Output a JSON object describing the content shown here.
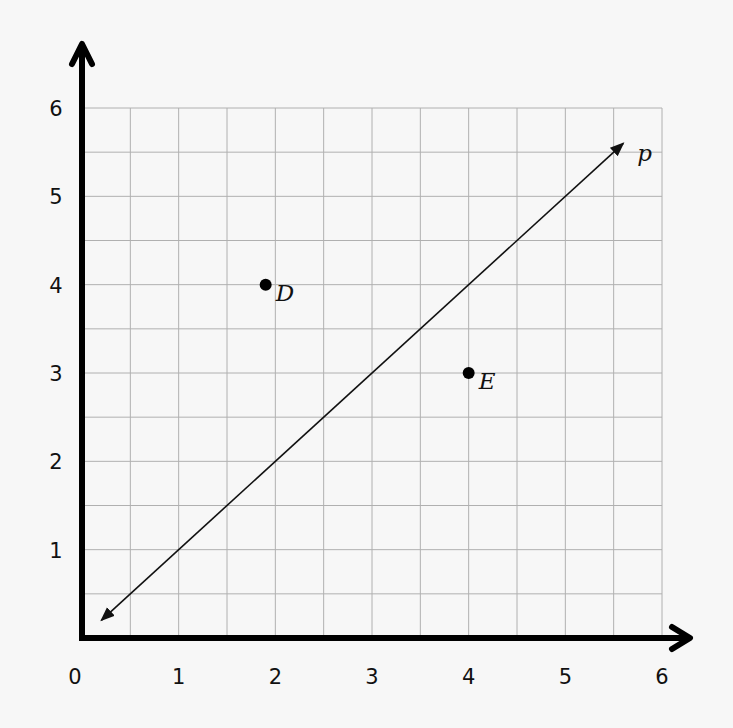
{
  "chart_data": {
    "type": "scatter",
    "title": "",
    "xlabel": "",
    "ylabel": "",
    "xlim": [
      0,
      6
    ],
    "ylim": [
      0,
      6
    ],
    "grid": true,
    "grid_step": 0.5,
    "x_ticks": [
      "0",
      "1",
      "2",
      "3",
      "4",
      "5",
      "6"
    ],
    "y_ticks": [
      "1",
      "2",
      "3",
      "4",
      "5",
      "6"
    ],
    "points": [
      {
        "label": "D",
        "x": 1.9,
        "y": 4.0
      },
      {
        "label": "E",
        "x": 4.0,
        "y": 3.0
      }
    ],
    "lines": [
      {
        "label": "p",
        "from": [
          0.2,
          0.2
        ],
        "to": [
          5.6,
          5.6
        ],
        "arrows": "both"
      }
    ]
  }
}
